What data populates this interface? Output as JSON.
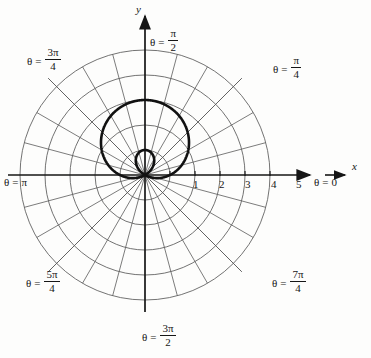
{
  "figure": {
    "kind": "polar-plot",
    "background_color": "#fdfdfc",
    "ink_color": "#161616",
    "grid_color": "#5a5a5a",
    "curve_color": "#111111"
  },
  "axes": {
    "x_axis_label": "x",
    "y_axis_label": "y",
    "origin_px": [
      145,
      175
    ],
    "unit_px": 25,
    "x_ticks": [
      {
        "label": "1",
        "value": 1
      },
      {
        "label": "2",
        "value": 2
      },
      {
        "label": "3",
        "value": 3
      },
      {
        "label": "4",
        "value": 4
      },
      {
        "label": "5",
        "value": 5
      }
    ]
  },
  "angle_labels": [
    {
      "id": "theta-0",
      "theta_symbol": "θ",
      "equals": "=",
      "whole": "0",
      "numerator": "",
      "denominator": "",
      "value_rad": 0.0
    },
    {
      "id": "theta-pi-4",
      "theta_symbol": "θ",
      "equals": "=",
      "whole": "",
      "numerator": "π",
      "denominator": "4",
      "value_rad": 0.7853981634
    },
    {
      "id": "theta-pi-2",
      "theta_symbol": "θ",
      "equals": "=",
      "whole": "",
      "numerator": "π",
      "denominator": "2",
      "value_rad": 1.5707963268
    },
    {
      "id": "theta-3pi-4",
      "theta_symbol": "θ",
      "equals": "=",
      "whole": "",
      "numerator": "3π",
      "denominator": "4",
      "value_rad": 2.3561944902
    },
    {
      "id": "theta-pi",
      "theta_symbol": "θ",
      "equals": "=",
      "whole": "π",
      "numerator": "",
      "denominator": "",
      "value_rad": 3.1415926536
    },
    {
      "id": "theta-5pi-4",
      "theta_symbol": "θ",
      "equals": "=",
      "whole": "",
      "numerator": "5π",
      "denominator": "4",
      "value_rad": 3.926990817
    },
    {
      "id": "theta-3pi-2",
      "theta_symbol": "θ",
      "equals": "=",
      "whole": "",
      "numerator": "3π",
      "denominator": "2",
      "value_rad": 4.7123889804
    },
    {
      "id": "theta-7pi-4",
      "theta_symbol": "θ",
      "equals": "=",
      "whole": "",
      "numerator": "7π",
      "denominator": "4",
      "value_rad": 5.4977871438
    }
  ],
  "chart_data": {
    "type": "line",
    "coordinate_system": "polar",
    "title": "",
    "xlabel": "x",
    "ylabel": "y",
    "grid": true,
    "legend": null,
    "radial_grid_circles": [
      1,
      2,
      3,
      4,
      5
    ],
    "angular_grid_step_deg": 15,
    "angular_grid_labeled_deg": [
      0,
      45,
      90,
      135,
      180,
      225,
      270,
      315
    ],
    "rlim": [
      0,
      5
    ],
    "xlim_units": [
      -5.2,
      6.6
    ],
    "ylim_units": [
      -5.2,
      5.2
    ],
    "x_tick_labels": [
      "1",
      "2",
      "3",
      "4",
      "5"
    ],
    "x_tick_values": [
      1,
      2,
      3,
      4,
      5
    ],
    "series": [
      {
        "name": "limacon",
        "equation_form": "r = 1 + 2 sin(theta)",
        "a": 1,
        "b": 2,
        "inner_loop": true,
        "outer_loop_max_r": 3,
        "outer_loop_max_point": {
          "r": 3,
          "theta_deg": 90
        },
        "inner_loop_max_r": 1,
        "inner_loop_extent": {
          "r": 1,
          "theta_deg": 270
        },
        "zeros_theta_deg": [
          210,
          330
        ],
        "max_x_units": 1.76,
        "min_x_units": -1.76,
        "max_y_units": 3.0,
        "passes_through_origin": true
      }
    ]
  }
}
